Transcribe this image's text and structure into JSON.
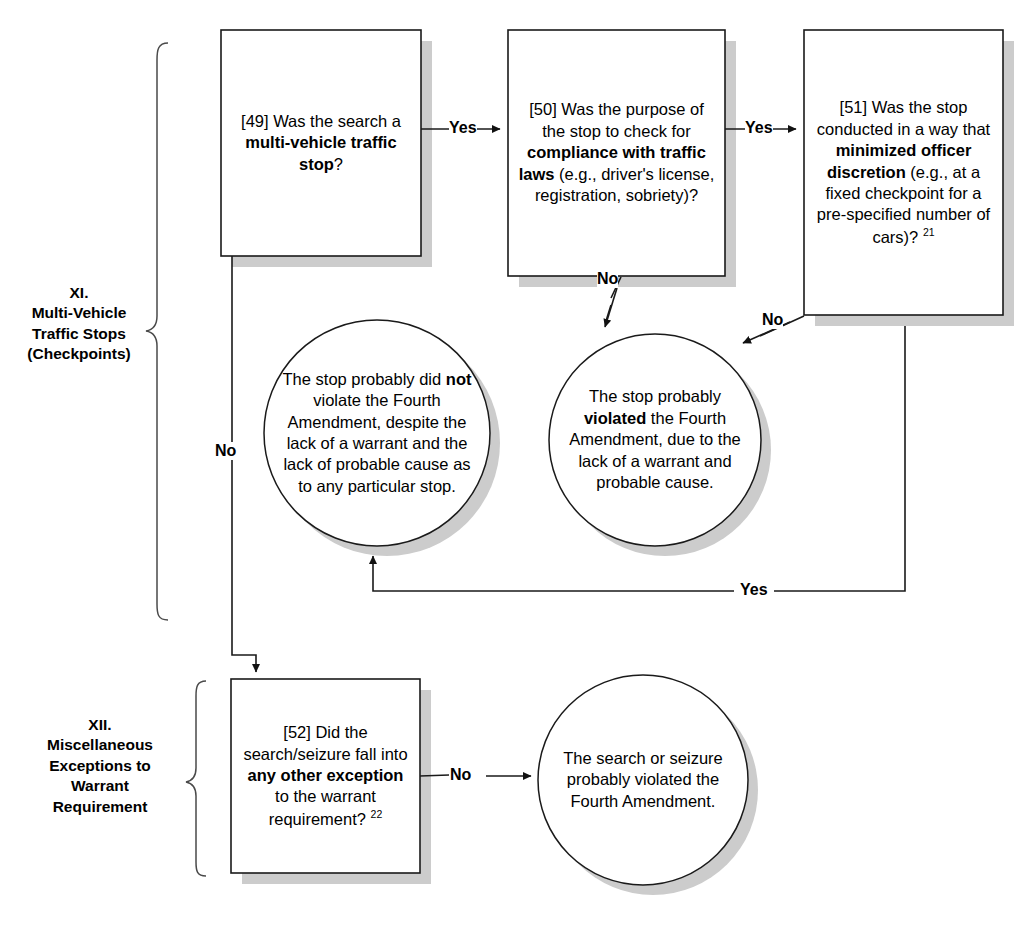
{
  "diagram": {
    "colors": {
      "stroke": "#1a1a1a",
      "fill": "#ffffff",
      "shadow": "#cccccc",
      "text": "#000000"
    }
  },
  "sections": [
    {
      "id": "section-xi",
      "numeral": "XI.",
      "lines": [
        "XI.",
        "Multi-Vehicle",
        "Traffic Stops",
        "(Checkpoints)"
      ]
    },
    {
      "id": "section-xii",
      "numeral": "XII.",
      "lines": [
        "XII.",
        "Miscellaneous",
        "Exceptions to",
        "Warrant",
        "Requirement"
      ]
    }
  ],
  "nodes": [
    {
      "id": "q49",
      "shape": "box",
      "number": "[49]",
      "html": "[49] Was the search a <b>multi-vehicle traffic stop</b>?",
      "plain": "[49] Was the search a multi-vehicle traffic stop?"
    },
    {
      "id": "q50",
      "shape": "box",
      "number": "[50]",
      "html": "[50] Was the purpose of the stop to check for <b>compliance with traffic laws</b> (e.g., driver's license, registration, sobriety)?",
      "plain": "[50] Was the purpose of the stop to check for compliance with traffic laws (e.g., driver's license, registration, sobriety)?"
    },
    {
      "id": "q51",
      "shape": "box",
      "number": "[51]",
      "html": "[51] Was the stop conducted in a way that <b>minimized officer discretion</b> (e.g., at a fixed checkpoint for a pre-specified number of cars)? <sup>21</sup>",
      "plain": "[51] Was the stop conducted in a way that minimized officer discretion (e.g., at a fixed checkpoint for a pre-specified number of cars)? 21",
      "footnote": "21"
    },
    {
      "id": "q52",
      "shape": "box",
      "number": "[52]",
      "html": "[52] Did the search/seizure fall into <b>any other exception</b> to the warrant requirement? <sup>22</sup>",
      "plain": "[52] Did the search/seizure fall into any other exception to the warrant requirement? 22",
      "footnote": "22"
    },
    {
      "id": "outcome-no-violation",
      "shape": "circle",
      "html": "The stop probably did <b>not</b> violate the Fourth Amendment, despite the lack of a warrant and the lack of probable cause as to any particular stop.",
      "plain": "The stop probably did not violate the Fourth Amendment, despite the lack of a warrant and the lack of probable cause as to any particular stop."
    },
    {
      "id": "outcome-violation",
      "shape": "circle",
      "html": "The stop probably <b>violated</b> the Fourth Amendment, due to the lack of a warrant and probable cause.",
      "plain": "The stop probably violated the Fourth Amendment, due to the lack of a warrant and probable cause."
    },
    {
      "id": "outcome-search-violation",
      "shape": "circle",
      "html": "The search or seizure probably violated the Fourth Amendment.",
      "plain": "The search or seizure probably violated the Fourth Amendment."
    }
  ],
  "edges": [
    {
      "id": "edge-49-yes-50",
      "from": "q49",
      "to": "q50",
      "label": "Yes"
    },
    {
      "id": "edge-50-yes-51",
      "from": "q50",
      "to": "q51",
      "label": "Yes"
    },
    {
      "id": "edge-50-no-violation",
      "from": "q50",
      "to": "outcome-violation",
      "label": "No"
    },
    {
      "id": "edge-51-no-violation",
      "from": "q51",
      "to": "outcome-violation",
      "label": "No"
    },
    {
      "id": "edge-51-yes-noviolation",
      "from": "q51",
      "to": "outcome-no-violation",
      "label": "Yes"
    },
    {
      "id": "edge-49-no-52",
      "from": "q49",
      "to": "q52",
      "label": "No"
    },
    {
      "id": "edge-52-no-searchviolation",
      "from": "q52",
      "to": "outcome-search-violation",
      "label": "No"
    }
  ]
}
